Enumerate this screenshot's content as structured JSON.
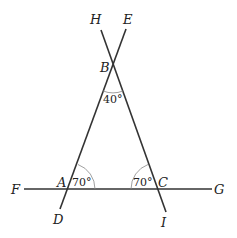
{
  "diagram": {
    "title": "",
    "points": {
      "H": "H",
      "E": "E",
      "B": "B",
      "F": "F",
      "A": "A",
      "C": "C",
      "G": "G",
      "D": "D",
      "I": "I"
    },
    "angles": {
      "angle_B": "40°",
      "angle_A": "70°",
      "angle_C": "70°"
    },
    "lines": [
      {
        "name": "line-DE",
        "from": "D",
        "to": "E"
      },
      {
        "name": "line-HI",
        "from": "H",
        "to": "I"
      },
      {
        "name": "line-FG",
        "from": "F",
        "to": "G"
      }
    ],
    "colors": {
      "line": "#333333",
      "arc": "#888888",
      "text": "#222222",
      "background": "#ffffff"
    }
  }
}
